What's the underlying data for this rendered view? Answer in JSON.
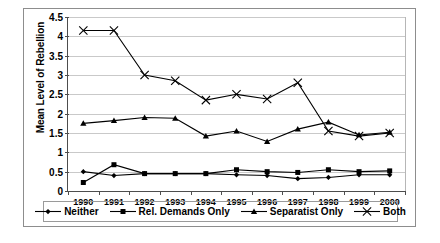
{
  "chart_data": {
    "type": "line",
    "title": "",
    "xlabel": "",
    "ylabel": "Mean Level of Rebellion",
    "categories": [
      "1990",
      "1991",
      "1992",
      "1993",
      "1994",
      "1995",
      "1996",
      "1997",
      "1998",
      "1999",
      "2000"
    ],
    "ylim": [
      0,
      4.5
    ],
    "yticks": [
      "0",
      "0.5",
      "1",
      "1.5",
      "2",
      "2.5",
      "3",
      "3.5",
      "4",
      "4.5"
    ],
    "grid": true,
    "legend_position": "bottom",
    "series": [
      {
        "name": "Neither",
        "marker": "diamond",
        "color": "#000000",
        "values": [
          0.5,
          0.4,
          0.45,
          0.45,
          0.45,
          0.42,
          0.4,
          0.32,
          0.35,
          0.42,
          0.42
        ]
      },
      {
        "name": "Rel. Demands Only",
        "marker": "square",
        "color": "#000000",
        "values": [
          0.22,
          0.68,
          0.45,
          0.45,
          0.45,
          0.55,
          0.5,
          0.48,
          0.55,
          0.5,
          0.52
        ]
      },
      {
        "name": "Separatist Only",
        "marker": "triangle",
        "color": "#000000",
        "values": [
          1.75,
          1.82,
          1.9,
          1.88,
          1.42,
          1.55,
          1.28,
          1.6,
          1.78,
          1.45,
          1.52
        ]
      },
      {
        "name": "Both",
        "marker": "cross",
        "color": "#000000",
        "values": [
          4.15,
          4.15,
          3.0,
          2.85,
          2.35,
          2.5,
          2.38,
          2.8,
          1.55,
          1.42,
          1.5
        ]
      }
    ]
  },
  "legend": {
    "items": [
      {
        "label": "Neither",
        "marker": "diamond"
      },
      {
        "label": "Rel. Demands Only",
        "marker": "square"
      },
      {
        "label": "Separatist Only",
        "marker": "triangle"
      },
      {
        "label": "Both",
        "marker": "cross"
      }
    ]
  }
}
